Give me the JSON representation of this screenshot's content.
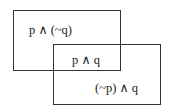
{
  "diagram": {
    "type": "venn-rectangles",
    "regions": {
      "p_only": "p ∧ (~q)",
      "both": "p ∧ q",
      "q_only": "(~p) ∧ q"
    },
    "stroke_color": "#333333",
    "background": "#ffffff"
  }
}
